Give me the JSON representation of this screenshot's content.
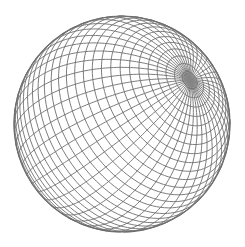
{
  "image": {
    "subject": "wireframe sphere",
    "background": "#ffffff",
    "line_color": "#6e6e6e",
    "pole_color": "#8a8a8a"
  },
  "sphere": {
    "cx": 122,
    "cy": 124,
    "r": 108,
    "pole_screen": [
      190,
      80
    ],
    "latitude_count": 36,
    "longitude_count": 48
  }
}
